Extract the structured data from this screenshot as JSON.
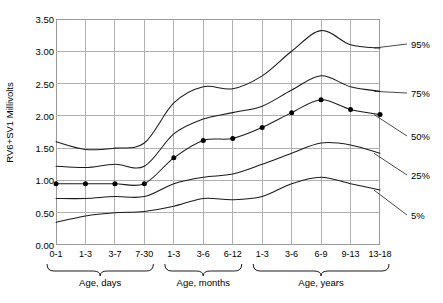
{
  "chart_data": {
    "type": "line",
    "title": "",
    "xlabel": "",
    "ylabel": "RV6+SV1 Millivolts",
    "ylim": [
      0.0,
      3.5
    ],
    "ytick_step": 0.5,
    "grid": true,
    "legend_position": "right-inline",
    "categories": [
      "0-1",
      "1-3",
      "3-7",
      "7-30",
      "1-3",
      "3-6",
      "6-12",
      "1-3",
      "3-6",
      "6-9",
      "9-13",
      "13-18"
    ],
    "ytick_labels": [
      "0.00",
      "0.50",
      "1.00",
      "1.50",
      "2.00",
      "2.50",
      "3.00",
      "3.50"
    ],
    "ytick_values": [
      0.0,
      0.5,
      1.0,
      1.5,
      2.0,
      2.5,
      3.0,
      3.5
    ],
    "group_brackets": [
      {
        "label": "Age, days",
        "start_index": 0,
        "end_index": 3
      },
      {
        "label": "Age, months",
        "start_index": 4,
        "end_index": 6
      },
      {
        "label": "Age, years",
        "start_index": 7,
        "end_index": 11
      }
    ],
    "series": [
      {
        "name": "95%",
        "label": "95%",
        "values": [
          1.6,
          1.48,
          1.5,
          1.58,
          2.2,
          2.45,
          2.42,
          2.62,
          3.0,
          3.32,
          3.1,
          3.05
        ]
      },
      {
        "name": "75%",
        "label": "75%",
        "values": [
          1.22,
          1.2,
          1.25,
          1.22,
          1.72,
          1.95,
          2.05,
          2.15,
          2.4,
          2.62,
          2.45,
          2.38
        ]
      },
      {
        "name": "50%",
        "label": "50%",
        "values": [
          0.95,
          0.95,
          0.95,
          0.95,
          1.35,
          1.62,
          1.65,
          1.82,
          2.05,
          2.25,
          2.1,
          2.02
        ]
      },
      {
        "name": "25%",
        "label": "25%",
        "values": [
          0.72,
          0.72,
          0.75,
          0.75,
          0.95,
          1.05,
          1.1,
          1.25,
          1.42,
          1.58,
          1.55,
          1.42
        ]
      },
      {
        "name": "5%",
        "label": "5%",
        "values": [
          0.35,
          0.45,
          0.5,
          0.52,
          0.6,
          0.72,
          0.7,
          0.75,
          0.95,
          1.05,
          0.95,
          0.85
        ]
      }
    ],
    "markers": {
      "series": "50%",
      "note": "filled black dots on median curve at each category",
      "values": [
        0.95,
        0.95,
        0.95,
        0.95,
        1.35,
        1.62,
        1.65,
        1.82,
        2.05,
        2.25,
        2.1,
        2.02
      ]
    },
    "colors": {
      "curve": "#1a1a1a",
      "grid": "#b0b0b0",
      "frame": "#8a8a8a",
      "marker": "#000000",
      "text": "#000000",
      "background": "#ffffff"
    }
  }
}
